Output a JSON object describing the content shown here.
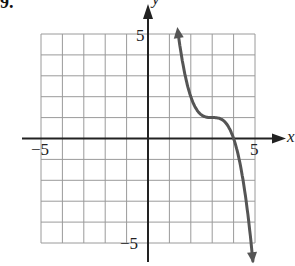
{
  "problem_label": "9.",
  "chart_data": {
    "type": "line",
    "title": "",
    "xlabel": "x",
    "ylabel": "y",
    "xlim": [
      -5,
      5
    ],
    "ylim": [
      -5,
      5
    ],
    "grid": true,
    "grid_step": 1,
    "tick_labels": {
      "x": [
        "-5",
        "5"
      ],
      "y": [
        "5",
        "-5"
      ]
    },
    "series": [
      {
        "name": "f(x)",
        "description": "Cubic with inflection/plateau near (3, 1), decreasing; approx y = -(x-3)^3 + 1; arrows at both ends",
        "x": [
          1.4,
          1.6,
          1.8,
          2.0,
          2.2,
          2.5,
          2.8,
          3.0,
          3.2,
          3.5,
          3.8,
          4.0,
          4.2,
          4.4,
          4.6,
          4.8,
          4.9
        ],
        "values": [
          5.1,
          3.74,
          2.73,
          2.0,
          1.51,
          1.13,
          1.01,
          1.0,
          0.99,
          0.88,
          0.49,
          0.0,
          -0.73,
          -1.74,
          -3.1,
          -4.83,
          -5.86
        ]
      }
    ],
    "colors": {
      "curve": "#555555",
      "axes": "#222222",
      "grid": "#9a9a9a"
    }
  },
  "labels": {
    "x_axis": "x",
    "y_axis": "y",
    "x_min": "−5",
    "x_max": "5",
    "y_max": "5",
    "y_min": "−5"
  }
}
